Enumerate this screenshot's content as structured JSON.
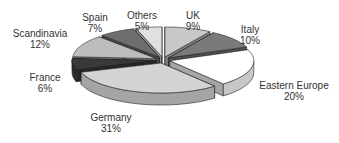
{
  "chart_data": {
    "type": "pie",
    "style": "3d-exploded",
    "title": "",
    "categories": [
      "UK",
      "Italy",
      "Eastern Europe",
      "Germany",
      "France",
      "Scandinavia",
      "Spain",
      "Others"
    ],
    "values": [
      9,
      10,
      20,
      31,
      6,
      12,
      7,
      5
    ],
    "unit": "%",
    "labels": [
      {
        "name": "UK",
        "pct": "9%"
      },
      {
        "name": "Italy",
        "pct": "10%"
      },
      {
        "name": "Eastern Europe",
        "pct": "20%"
      },
      {
        "name": "Germany",
        "pct": "31%"
      },
      {
        "name": "France",
        "pct": "6%"
      },
      {
        "name": "Scandinavia",
        "pct": "12%"
      },
      {
        "name": "Spain",
        "pct": "7%"
      },
      {
        "name": "Others",
        "pct": "5%"
      }
    ],
    "colors": [
      "#c8c8c8",
      "#7a7a7a",
      "#ffffff",
      "#d4d4d4",
      "#3a3a3a",
      "#bdbdbd",
      "#6e6e6e",
      "#e0e0e0"
    ],
    "legend": "none (direct labels)"
  }
}
